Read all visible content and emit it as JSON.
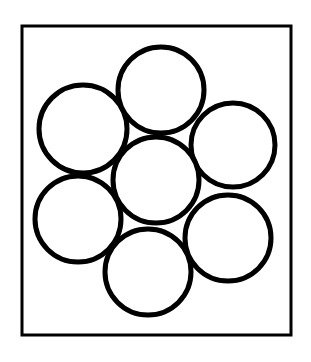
{
  "figure": {
    "background_color": "#ffffff",
    "stroke_color": "#000000",
    "fill_color": "#ffffff",
    "canvas": {
      "width": 311,
      "height": 362
    },
    "frame": {
      "label": "bounding-rectangle",
      "x": 22,
      "y": 26,
      "width": 269,
      "height": 309,
      "stroke_width": 3
    },
    "circles": {
      "count": 7,
      "radius": 43,
      "stroke_width": 5,
      "items": [
        {
          "label": "circle-center",
          "cx": 156,
          "cy": 180,
          "r": 43
        },
        {
          "label": "circle-top",
          "cx": 161,
          "cy": 90,
          "r": 43
        },
        {
          "label": "circle-upper-right",
          "cx": 233,
          "cy": 145,
          "r": 42
        },
        {
          "label": "circle-lower-right",
          "cx": 228,
          "cy": 238,
          "r": 43
        },
        {
          "label": "circle-bottom",
          "cx": 148,
          "cy": 272,
          "r": 43
        },
        {
          "label": "circle-lower-left",
          "cx": 78,
          "cy": 219,
          "r": 43
        },
        {
          "label": "circle-upper-left",
          "cx": 83,
          "cy": 129,
          "r": 44
        }
      ]
    },
    "caption": ""
  }
}
